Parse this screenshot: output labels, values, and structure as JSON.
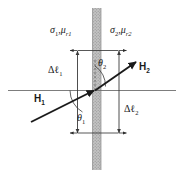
{
  "figure": {
    "type": "physics-boundary-diagram",
    "media": {
      "left": {
        "conductivity_symbol": "σ",
        "conductivity_subscript": "1",
        "permeability_symbol": "μ",
        "permeability_subscript": "r1",
        "label": "σ₁ , μ_r1"
      },
      "right": {
        "conductivity_symbol": "σ",
        "conductivity_subscript": "2",
        "permeability_symbol": "μ",
        "permeability_subscript": "r2",
        "label": "σ₂ , μ_r2"
      }
    },
    "vectors": [
      {
        "name": "H1",
        "symbol": "H",
        "subscript": "1",
        "role": "incident-field",
        "side": "left"
      },
      {
        "name": "H2",
        "symbol": "H",
        "subscript": "2",
        "role": "transmitted-field",
        "side": "right"
      }
    ],
    "angles": [
      {
        "name": "theta1",
        "symbol": "θ",
        "subscript": "1",
        "measured_from": "interface-below-left"
      },
      {
        "name": "theta2",
        "symbol": "θ",
        "subscript": "2",
        "measured_from": "interface-normal-above"
      }
    ],
    "dimensions": [
      {
        "name": "delta-l1",
        "symbol": "Δℓ",
        "subscript": "1",
        "side": "left"
      },
      {
        "name": "delta-l2",
        "symbol": "Δℓ",
        "subscript": "2",
        "side": "right"
      }
    ],
    "colors": {
      "ink": "#1a1a1a",
      "line": "#6e6e6e",
      "interface_fill": "#b6b6b6",
      "interface_edge": "#8a8a8a",
      "background": "#ffffff"
    }
  }
}
